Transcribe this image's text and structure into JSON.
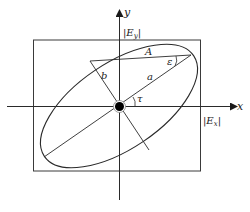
{
  "diagram": {
    "colors": {
      "stroke": "#2a2a2a",
      "background": "#ffffff"
    },
    "axes": {
      "x_label": "x",
      "y_label": "y"
    },
    "labels": {
      "ey": "|E",
      "ey_sub": "y",
      "ey_close": "|",
      "ex": "|E",
      "ex_sub": "x",
      "ex_close": "|",
      "A": "A",
      "a": "a",
      "b": "b",
      "epsilon": "ε",
      "tau": "τ"
    }
  }
}
